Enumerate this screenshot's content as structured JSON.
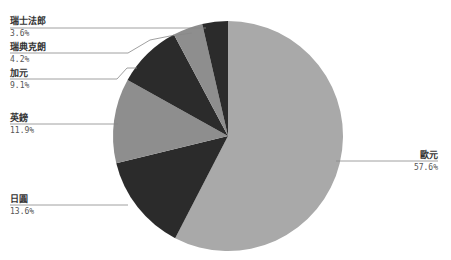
{
  "chart_data": {
    "type": "pie",
    "title": "",
    "start_angle_deg": 0,
    "direction": "clockwise",
    "categories": [
      "歐元",
      "日圓",
      "英鎊",
      "加元",
      "瑞典克朗",
      "瑞士法郎"
    ],
    "values": [
      57.6,
      13.6,
      11.9,
      9.1,
      4.2,
      3.6
    ],
    "labels": [
      "57.6%",
      "13.6%",
      "11.9%",
      "9.1%",
      "4.2%",
      "3.6%"
    ],
    "colors": [
      "#a9a9a9",
      "#2b2b2b",
      "#8e8e8e",
      "#2b2b2b",
      "#8e8e8e",
      "#2b2b2b"
    ],
    "legend": "none",
    "leader_lines": true
  },
  "geometry": {
    "cx": 228,
    "cy": 136,
    "r": 115
  },
  "labels": {
    "eur": {
      "name": "歐元",
      "pct": "57.6%"
    },
    "jpy": {
      "name": "日圓",
      "pct": "13.6%"
    },
    "gbp": {
      "name": "英鎊",
      "pct": "11.9%"
    },
    "cad": {
      "name": "加元",
      "pct": "9.1%"
    },
    "sek": {
      "name": "瑞典克朗",
      "pct": "4.2%"
    },
    "chf": {
      "name": "瑞士法郎",
      "pct": "3.6%"
    }
  }
}
